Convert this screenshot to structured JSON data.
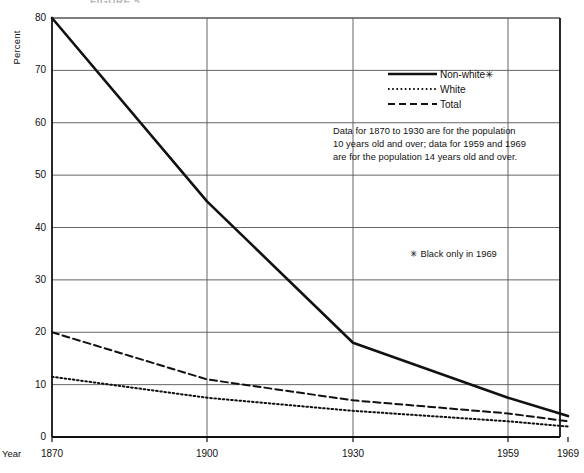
{
  "figure": {
    "title_fragment": "FIGURE 5",
    "year_axis_label": "Year",
    "y_axis_label": "Percent",
    "data_note": "Data for 1870 to 1930 are for the population\n10 years old and over; data for 1959 and 1969\nare for the population 14 years old and over.",
    "footnote": "✳ Black only in 1969"
  },
  "chart_data": {
    "type": "line",
    "title": "FIGURE 5",
    "xlabel": "Year",
    "ylabel": "Percent",
    "x": [
      1870,
      1900,
      1930,
      1959,
      1969
    ],
    "tick_labels": [
      "1870",
      "1900",
      "1930",
      "1959",
      "1969"
    ],
    "ylim": [
      0,
      80
    ],
    "yticks": [
      0,
      10,
      20,
      30,
      40,
      50,
      60,
      70,
      80
    ],
    "ytick_labels": [
      "0",
      "10",
      "20",
      "30",
      "40",
      "50",
      "60",
      "70",
      "80"
    ],
    "grid": true,
    "grid_x_at": [
      1900,
      1930,
      1959
    ],
    "legend_position": "upper-right",
    "series": [
      {
        "name": "Non-white✳",
        "style": "solid",
        "color": "#111111",
        "values": [
          80,
          45,
          18,
          7.5,
          4
        ]
      },
      {
        "name": "White",
        "style": "dotted",
        "color": "#111111",
        "values": [
          11.5,
          7.5,
          5,
          3,
          2
        ]
      },
      {
        "name": "Total",
        "style": "dashed",
        "color": "#111111",
        "values": [
          20,
          11,
          7,
          4.5,
          3
        ]
      }
    ],
    "annotations": [
      "Data for 1870 to 1930 are for the population 10 years old and over; data for 1959 and 1969 are for the population 14 years old and over.",
      "✳ Black only in 1969"
    ]
  }
}
